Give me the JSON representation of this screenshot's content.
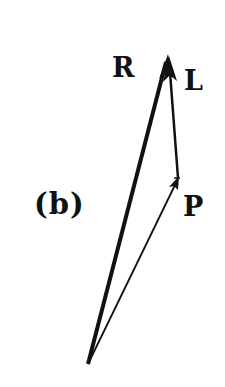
{
  "figure": {
    "panel_label": "(b)",
    "vectors": [
      {
        "name": "P",
        "label": "P",
        "from": "origin",
        "to": "P",
        "stroke": "thin"
      },
      {
        "name": "L",
        "label": "L",
        "from": "P",
        "to": "R",
        "stroke": "medium"
      },
      {
        "name": "R",
        "label": "R",
        "from": "origin",
        "to": "R",
        "stroke": "thick"
      }
    ],
    "colors": {
      "ink": "#111111",
      "background": "#ffffff"
    }
  },
  "labels": {
    "R": "R",
    "L": "L",
    "P": "P",
    "panel": "(b)"
  }
}
